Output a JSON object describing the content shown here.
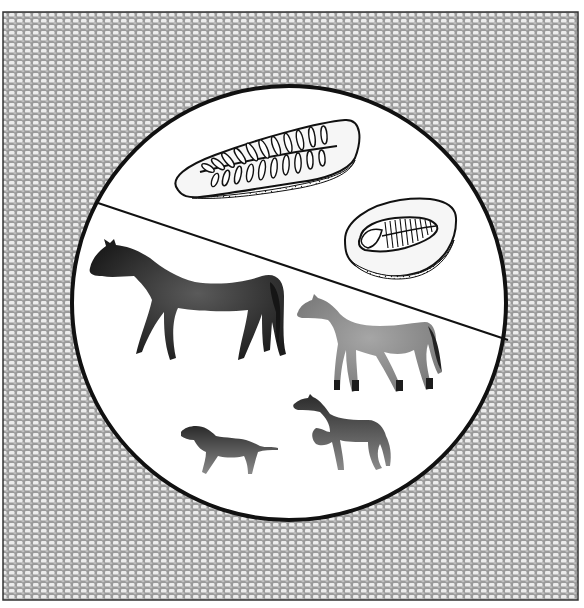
{
  "illustration": {
    "subject": "fossil-record-and-horse-evolution",
    "colors": {
      "page_background": "#ffffff",
      "frame_border": "#333333",
      "texture_base": "#9a9a9a",
      "texture_cells": "#ececec",
      "circle_fill": "#ffffff",
      "circle_stroke": "#111111",
      "divider_line": "#111111",
      "fossil_rock": "#f4f4f4",
      "fossil_ink": "#111111",
      "horse_modern": "#2a2a2a",
      "horse_mid": "#8c8c8c",
      "horse_small": "#3c3c3c"
    },
    "upper_section": {
      "items": [
        {
          "name": "fern-leaf-fossil"
        },
        {
          "name": "trilobite-fossil"
        }
      ]
    },
    "lower_section": {
      "items": [
        {
          "name": "modern-horse"
        },
        {
          "name": "mid-sized-ancestral-horse"
        },
        {
          "name": "small-early-horse"
        },
        {
          "name": "smallest-early-horse"
        }
      ]
    }
  }
}
